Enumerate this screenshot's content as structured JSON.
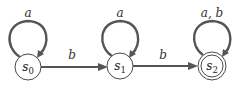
{
  "diagram": {
    "type": "finite-state-automaton",
    "states": [
      {
        "id": "s0",
        "name": "s",
        "sub": "0",
        "accepting": false
      },
      {
        "id": "s1",
        "name": "s",
        "sub": "1",
        "accepting": false
      },
      {
        "id": "s2",
        "name": "s",
        "sub": "2",
        "accepting": true
      }
    ],
    "transitions": [
      {
        "from": "s0",
        "to": "s0",
        "label": "a"
      },
      {
        "from": "s0",
        "to": "s1",
        "label": "b"
      },
      {
        "from": "s1",
        "to": "s1",
        "label": "a"
      },
      {
        "from": "s1",
        "to": "s2",
        "label": "b"
      },
      {
        "from": "s2",
        "to": "s2",
        "label": "a, b"
      }
    ],
    "colors": {
      "stroke": "#555555",
      "circle": "#4a4a4a",
      "background": "#ffffff"
    }
  }
}
